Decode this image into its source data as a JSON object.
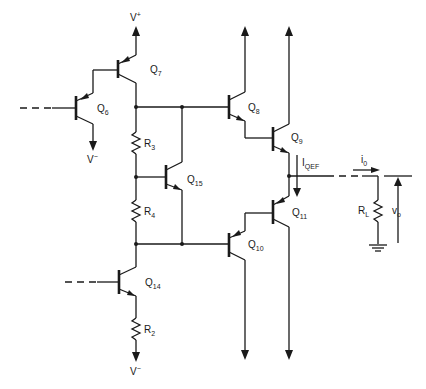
{
  "diagram": {
    "type": "circuit-schematic",
    "labels": {
      "vplus": {
        "main": "V",
        "sup": "+"
      },
      "vminus_q6": {
        "main": "V",
        "sup": "−"
      },
      "vminus_r2": {
        "main": "V",
        "sup": "−"
      },
      "q6": {
        "main": "Q",
        "sub": "6"
      },
      "q7": {
        "main": "Q",
        "sub": "7"
      },
      "q8": {
        "main": "Q",
        "sub": "8"
      },
      "q9": {
        "main": "Q",
        "sub": "9"
      },
      "q10": {
        "main": "Q",
        "sub": "10"
      },
      "q11": {
        "main": "Q",
        "sub": "11"
      },
      "q14": {
        "main": "Q",
        "sub": "14"
      },
      "q15": {
        "main": "Q",
        "sub": "15"
      },
      "r2": {
        "main": "R",
        "sub": "2"
      },
      "r3": {
        "main": "R",
        "sub": "3"
      },
      "r4": {
        "main": "R",
        "sub": "4"
      },
      "rl": {
        "main": "R",
        "sub": "L"
      },
      "iqef": {
        "main": "I",
        "sub": "QEF"
      },
      "i0": {
        "main": "i",
        "sub": "0"
      },
      "vo": {
        "main": "v",
        "sub": "o"
      }
    },
    "components": [
      {
        "id": "Q6",
        "kind": "pnp-transistor"
      },
      {
        "id": "Q7",
        "kind": "pnp-transistor"
      },
      {
        "id": "Q8",
        "kind": "npn-transistor"
      },
      {
        "id": "Q9",
        "kind": "npn-transistor"
      },
      {
        "id": "Q10",
        "kind": "pnp-transistor"
      },
      {
        "id": "Q11",
        "kind": "pnp-transistor"
      },
      {
        "id": "Q14",
        "kind": "npn-transistor"
      },
      {
        "id": "Q15",
        "kind": "npn-transistor"
      },
      {
        "id": "R2",
        "kind": "resistor"
      },
      {
        "id": "R3",
        "kind": "resistor"
      },
      {
        "id": "R4",
        "kind": "resistor"
      },
      {
        "id": "RL",
        "kind": "resistor"
      },
      {
        "id": "GND",
        "kind": "ground"
      }
    ]
  }
}
